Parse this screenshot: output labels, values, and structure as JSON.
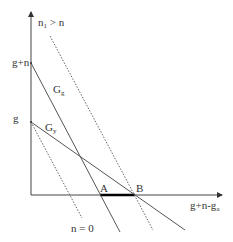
{
  "diagram": {
    "axes": {
      "y_axis_ticks": [
        {
          "label": "g+n",
          "value_position": 63
        },
        {
          "label": "g",
          "value_position": 122
        }
      ],
      "x_axis_label": {
        "main": "g+n-g",
        "sub": "a"
      }
    },
    "curves": [
      {
        "id": "G_g",
        "label_main": "G",
        "label_sub": "g",
        "style": "solid"
      },
      {
        "id": "G_y",
        "label_main": "G",
        "label_sub": "y",
        "style": "solid"
      },
      {
        "id": "n1",
        "label_main": "n",
        "label_sub": "1",
        "label_rest": " > n",
        "style": "dotted"
      },
      {
        "id": "n0",
        "label": "n = 0",
        "style": "dotted"
      }
    ],
    "points": [
      {
        "label": "A"
      },
      {
        "label": "B"
      }
    ],
    "colors": {
      "line": "#444444",
      "dotted": "#666666",
      "segment": "#000000",
      "text": "#333333"
    }
  }
}
